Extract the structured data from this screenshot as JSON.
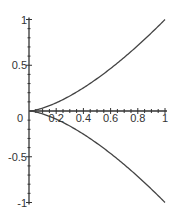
{
  "chart_data": {
    "type": "line",
    "title": "",
    "xlabel": "",
    "ylabel": "",
    "xlim": [
      0,
      1
    ],
    "ylim": [
      -1,
      1
    ],
    "grid": false,
    "legend": null,
    "x_ticks": [
      {
        "value": 0,
        "label": "0"
      },
      {
        "value": 0.2,
        "label": "0.2"
      },
      {
        "value": 0.4,
        "label": "0.4"
      },
      {
        "value": 0.6,
        "label": "0.6"
      },
      {
        "value": 0.8,
        "label": "0.8"
      },
      {
        "value": 1,
        "label": "1"
      }
    ],
    "y_ticks": [
      {
        "value": 1,
        "label": "1"
      },
      {
        "value": 0.5,
        "label": "0.5"
      },
      {
        "value": -0.5,
        "label": "-0.5"
      },
      {
        "value": -1,
        "label": "-1"
      }
    ],
    "x": [
      0,
      0.1,
      0.2,
      0.3,
      0.4,
      0.5,
      0.6,
      0.7,
      0.8,
      0.9,
      1.0
    ],
    "series": [
      {
        "name": "upper branch",
        "values": [
          0,
          0.032,
          0.089,
          0.164,
          0.253,
          0.354,
          0.465,
          0.586,
          0.716,
          0.854,
          1.0
        ]
      },
      {
        "name": "lower branch",
        "values": [
          0,
          -0.032,
          -0.089,
          -0.164,
          -0.253,
          -0.354,
          -0.465,
          -0.586,
          -0.716,
          -0.854,
          -1.0
        ]
      }
    ],
    "colors": {
      "curve": "#444444",
      "axis": "#333333"
    }
  }
}
